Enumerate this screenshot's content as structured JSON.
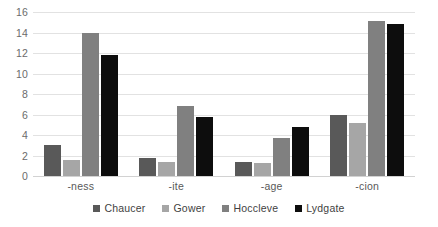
{
  "chart_data": {
    "type": "bar",
    "title": "",
    "subtitle": "",
    "xlabel": "",
    "ylabel": "",
    "ylim": [
      0,
      16
    ],
    "ytick_step": 2,
    "yticks": [
      16,
      14,
      12,
      10,
      8,
      6,
      4,
      2,
      0
    ],
    "grid": "horizontal",
    "legend_position": "bottom",
    "categories": [
      "-ness",
      "-ite",
      "-age",
      "-cion"
    ],
    "series": [
      {
        "name": "Chaucer",
        "color": "#595959",
        "values": [
          3.0,
          1.8,
          1.4,
          6.0
        ]
      },
      {
        "name": "Gower",
        "color": "#a6a6a6",
        "values": [
          1.6,
          1.4,
          1.3,
          5.2
        ]
      },
      {
        "name": "Hoccleve",
        "color": "#808080",
        "values": [
          14.0,
          6.8,
          3.7,
          15.1
        ]
      },
      {
        "name": "Lydgate",
        "color": "#0d0d0d",
        "values": [
          11.8,
          5.8,
          4.8,
          14.8
        ]
      }
    ]
  },
  "style": {
    "background": "#ffffff",
    "gridline_color": "#e2e2e2",
    "axis_text_color": "#6b6b6b",
    "legend_text_color": "#3f3f3f"
  }
}
